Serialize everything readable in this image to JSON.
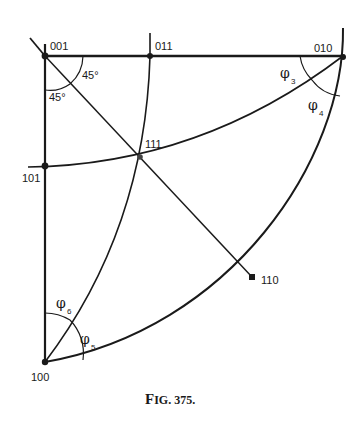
{
  "figure": {
    "caption": "Fig. 375.",
    "caption_prefix": "F",
    "caption_rest": "IG. 375.",
    "poles": {
      "p001": "001",
      "p011": "011",
      "p010": "010",
      "p101": "101",
      "p111": "111",
      "p110": "110",
      "p100": "100"
    },
    "angles": {
      "a1": "45°",
      "a2": "45°"
    },
    "phi": {
      "symbol": "φ",
      "phi3": "3",
      "phi4": "4",
      "phi5": "5",
      "phi6": "6"
    },
    "colors": {
      "ink": "#1a1a1a",
      "background": "#ffffff"
    }
  }
}
